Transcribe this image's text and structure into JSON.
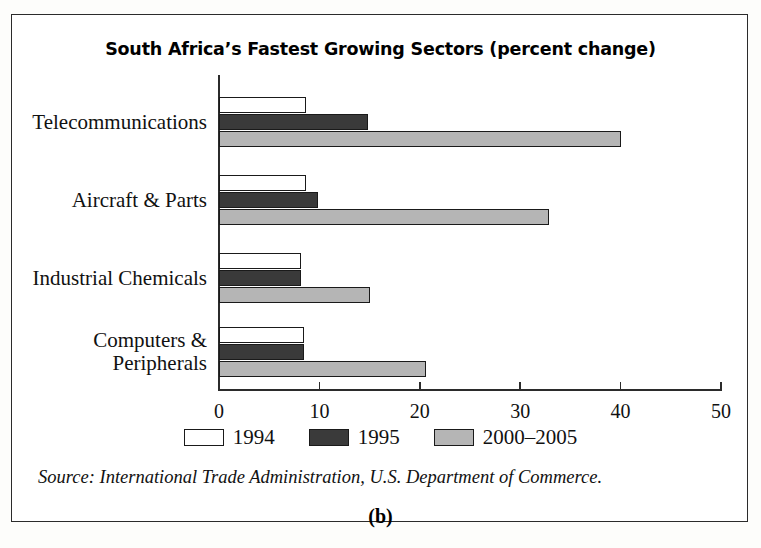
{
  "figure": {
    "panel_label": "(b)",
    "source": "Source: International Trade Administration, U.S. Department of Commerce."
  },
  "chart_data": {
    "type": "bar",
    "orientation": "horizontal",
    "title": "South Africa’s Fastest Growing Sectors (percent change)",
    "xlabel": "",
    "ylabel": "",
    "xlim": [
      0,
      50
    ],
    "xticks": [
      0,
      10,
      20,
      30,
      40,
      50
    ],
    "xtick_labels": [
      "0",
      "10",
      "20",
      "30",
      "40",
      "50"
    ],
    "grid": false,
    "legend_position": "bottom",
    "categories": [
      "Telecommunications",
      "Aircraft & Parts",
      "Industrial Chemicals",
      "Computers &\nPeripherals"
    ],
    "series": [
      {
        "name": "1994",
        "color": "#ffffff",
        "values": [
          8.7,
          8.7,
          8.2,
          8.5
        ]
      },
      {
        "name": "1995",
        "color": "#3a3a3a",
        "values": [
          14.8,
          9.9,
          8.2,
          8.5
        ]
      },
      {
        "name": "2000–2005",
        "color": "#b5b5b5",
        "values": [
          40.0,
          32.9,
          15.0,
          20.6
        ]
      }
    ]
  }
}
